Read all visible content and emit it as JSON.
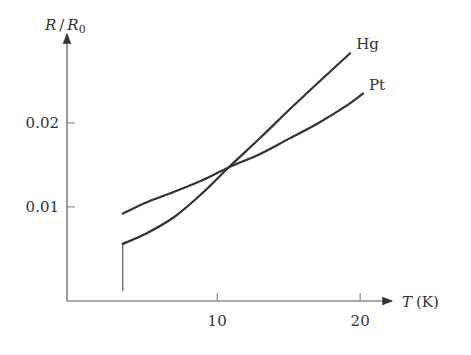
{
  "chart_data": {
    "type": "line",
    "title": "",
    "xlabel": "T (K)",
    "xlabel_var": "T",
    "xlabel_unit": "(K)",
    "ylabel": "R/R0",
    "ylabel_parts": {
      "num": "R",
      "slash": "/",
      "den": "R",
      "sub": "0"
    },
    "xlim": [
      -0.5,
      21
    ],
    "ylim": [
      -0.0012,
      0.032
    ],
    "x_ticks": [
      10,
      20
    ],
    "x_tick_labels": [
      "10",
      "20"
    ],
    "y_ticks": [
      0.01,
      0.02
    ],
    "y_tick_labels": [
      "0.01",
      "0.02"
    ],
    "grid": false,
    "legend": "inline labels at line ends",
    "drop_line_x": 3.4,
    "series": [
      {
        "name": "Hg",
        "x": [
          3.4,
          3.4,
          5,
          7,
          9,
          10.8,
          13,
          15,
          17,
          19.3
        ],
        "y": [
          0,
          0.0056,
          0.0068,
          0.0088,
          0.0117,
          0.0147,
          0.0182,
          0.0215,
          0.0247,
          0.0283
        ]
      },
      {
        "name": "Pt",
        "x": [
          3.4,
          5,
          7,
          9,
          10.8,
          13,
          15,
          17,
          19,
          20.2
        ],
        "y": [
          0.0092,
          0.0105,
          0.0118,
          0.0132,
          0.0147,
          0.0163,
          0.0181,
          0.0199,
          0.022,
          0.0235
        ]
      }
    ]
  }
}
